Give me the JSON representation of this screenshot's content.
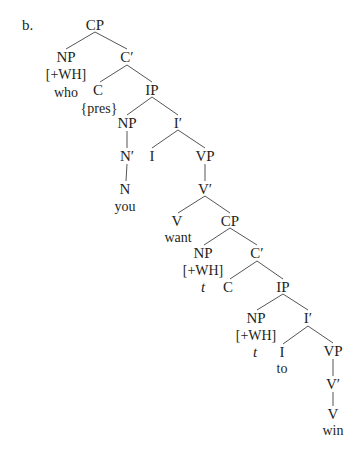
{
  "example_label": "b.",
  "colors": {
    "ink": "#231f20",
    "line": "#555555",
    "background": "#ffffff"
  },
  "nodes": [
    {
      "id": "cp1",
      "text": "CP",
      "x": 95,
      "y": 25
    },
    {
      "id": "np1",
      "text": "NP",
      "x": 66,
      "y": 57
    },
    {
      "id": "wh1",
      "text": "[+WH]",
      "x": 66,
      "y": 75,
      "small": true
    },
    {
      "id": "who",
      "text": "who",
      "x": 66,
      "y": 93,
      "small": true
    },
    {
      "id": "cbar1",
      "text": "C′",
      "x": 127,
      "y": 57
    },
    {
      "id": "c1",
      "text": "C",
      "x": 98,
      "y": 90
    },
    {
      "id": "pres",
      "text": "{pres}",
      "x": 99,
      "y": 109,
      "small": true
    },
    {
      "id": "ip1",
      "text": "IP",
      "x": 152,
      "y": 90
    },
    {
      "id": "np2",
      "text": "NP",
      "x": 127,
      "y": 123
    },
    {
      "id": "nbar",
      "text": "N′",
      "x": 127,
      "y": 156
    },
    {
      "id": "n",
      "text": "N",
      "x": 125,
      "y": 189
    },
    {
      "id": "you",
      "text": "you",
      "x": 125,
      "y": 207,
      "small": true
    },
    {
      "id": "ibar1",
      "text": "I′",
      "x": 178,
      "y": 123
    },
    {
      "id": "i1",
      "text": "I",
      "x": 152,
      "y": 156
    },
    {
      "id": "vp1",
      "text": "VP",
      "x": 205,
      "y": 156
    },
    {
      "id": "vbar1",
      "text": "V′",
      "x": 205,
      "y": 189
    },
    {
      "id": "v1",
      "text": "V",
      "x": 177,
      "y": 221
    },
    {
      "id": "want",
      "text": "want",
      "x": 178,
      "y": 238,
      "small": true
    },
    {
      "id": "cp2",
      "text": "CP",
      "x": 230,
      "y": 221
    },
    {
      "id": "np3",
      "text": "NP",
      "x": 203,
      "y": 253
    },
    {
      "id": "wh2",
      "text": "[+WH]",
      "x": 203,
      "y": 271,
      "small": true
    },
    {
      "id": "t1",
      "text": "t",
      "x": 203,
      "y": 287,
      "italic": true
    },
    {
      "id": "cbar2",
      "text": "C′",
      "x": 257,
      "y": 253
    },
    {
      "id": "c2",
      "text": "C",
      "x": 228,
      "y": 287
    },
    {
      "id": "ip2",
      "text": "IP",
      "x": 283,
      "y": 287
    },
    {
      "id": "np4",
      "text": "NP",
      "x": 256,
      "y": 318
    },
    {
      "id": "wh3",
      "text": "[+WH]",
      "x": 256,
      "y": 336,
      "small": true
    },
    {
      "id": "t2",
      "text": "t",
      "x": 255,
      "y": 352,
      "italic": true
    },
    {
      "id": "ibar2",
      "text": "I′",
      "x": 308,
      "y": 318
    },
    {
      "id": "i2",
      "text": "I",
      "x": 282,
      "y": 352
    },
    {
      "id": "to",
      "text": "to",
      "x": 282,
      "y": 369,
      "small": true
    },
    {
      "id": "vp2",
      "text": "VP",
      "x": 333,
      "y": 351
    },
    {
      "id": "vbar2",
      "text": "V′",
      "x": 333,
      "y": 384
    },
    {
      "id": "v2",
      "text": "V",
      "x": 333,
      "y": 414
    },
    {
      "id": "win",
      "text": "win",
      "x": 333,
      "y": 431,
      "small": true
    }
  ],
  "edges": [
    [
      95,
      32,
      66,
      49
    ],
    [
      95,
      32,
      127,
      49
    ],
    [
      127,
      65,
      100,
      82
    ],
    [
      127,
      65,
      152,
      82
    ],
    [
      152,
      97,
      127,
      115
    ],
    [
      152,
      97,
      178,
      115
    ],
    [
      127,
      131,
      127,
      148
    ],
    [
      127,
      164,
      126,
      181
    ],
    [
      178,
      130,
      152,
      148
    ],
    [
      178,
      130,
      205,
      148
    ],
    [
      205,
      164,
      205,
      181
    ],
    [
      205,
      196,
      178,
      213
    ],
    [
      205,
      196,
      230,
      213
    ],
    [
      230,
      228,
      204,
      245
    ],
    [
      230,
      228,
      257,
      245
    ],
    [
      257,
      261,
      230,
      279
    ],
    [
      257,
      261,
      283,
      279
    ],
    [
      283,
      294,
      257,
      310
    ],
    [
      283,
      294,
      308,
      310
    ],
    [
      308,
      326,
      283,
      344
    ],
    [
      308,
      326,
      333,
      343
    ],
    [
      333,
      359,
      333,
      376
    ],
    [
      333,
      392,
      333,
      406
    ]
  ]
}
